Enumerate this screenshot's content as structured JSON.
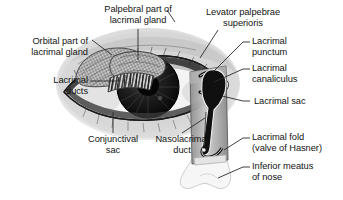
{
  "figure": {
    "background_color": "#ffffff",
    "text_color": "#141414",
    "leader_line_color": "#333333"
  },
  "labels": {
    "palpebral_part": "Palpebral part of\nlacrimal gland",
    "levator": "Levator palpebrae\nsuperioris",
    "orbital_part": "Orbital part of\nlacrimal gland",
    "lacrimal_punctum": "Lacrimal\npunctum",
    "lacrimal_ducts": "Lacrimal\nducts",
    "lacrimal_canaliculus": "Lacrimal\ncanaliculus",
    "lacrimal_sac": "Lacrimal sac",
    "conjunctival_sac": "Conjunctival\nsac",
    "nasolacrimal_duct": "Nasolacrimal\nduct",
    "lacrimal_fold": "Lacrimal fold\n(valve of Hasner)",
    "inferior_meatus": "Inferior meatus\nof nose"
  },
  "structures": {
    "orbital_gland_fill": "#b9b9b9",
    "palpebral_gland_fill": "#a8a8a8",
    "iris_color": "#1c1c1c",
    "pupil_color": "#0a0a0a",
    "sclera_color": "#f2f2f2",
    "skin_shading": "#c9c9c9",
    "duct_lumen_color": "#111111"
  }
}
